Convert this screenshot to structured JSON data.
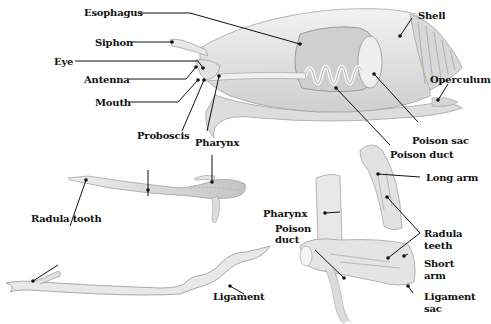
{
  "figure": {
    "panels": [
      {
        "id": "snail-body",
        "description": "Cutaway of cone snail showing internal venom apparatus"
      },
      {
        "id": "proboscis-detail",
        "description": "Extended proboscis with radula tooth"
      },
      {
        "id": "radula-tooth",
        "description": "Isolated radula tooth with ligament"
      },
      {
        "id": "radula-sac",
        "description": "Radula sac with long and short arms"
      }
    ]
  },
  "labels": {
    "esophagus": "Esophagus",
    "siphon": "Siphon",
    "eye": "Eye",
    "antenna": "Antenna",
    "mouth": "Mouth",
    "shell": "Shell",
    "operculum": "Operculum",
    "poison_sac": "Poison sac",
    "poison_duct_top": "Poison duct",
    "proboscis": "Proboscis",
    "pharynx_top": "Pharynx",
    "radula_tooth": "Radula tooth",
    "ligament": "Ligament",
    "long_arm": "Long arm",
    "pharynx_bottom": "Pharynx",
    "poison_duct_bottom_1": "Poison",
    "poison_duct_bottom_2": "duct",
    "radula_teeth_1": "Radula",
    "radula_teeth_2": "teeth",
    "short_arm_1": "Short",
    "short_arm_2": "arm",
    "ligament_sac_1": "Ligament",
    "ligament_sac_2": "sac"
  },
  "colors": {
    "background": "#ffffff",
    "ink": "#111111",
    "illustration_fill": "#e6e6e6",
    "illustration_shade": "#c9c9c9",
    "illustration_stroke": "#9a9a9a"
  }
}
